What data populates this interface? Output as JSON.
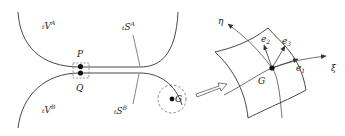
{
  "diagram": {
    "type": "contact-mechanics-schematic",
    "left_panel": {
      "bodies": [
        {
          "id": "body-A",
          "label_prefix": "t",
          "label": "V",
          "superscript": "A"
        },
        {
          "id": "body-B",
          "label_prefix": "t",
          "label": "V",
          "superscript": "B"
        }
      ],
      "surfaces": [
        {
          "id": "surface-A",
          "label_prefix": "t",
          "label": "S",
          "superscript": "A"
        },
        {
          "id": "surface-B",
          "label_prefix": "t",
          "label": "S",
          "superscript": "B"
        }
      ],
      "points": [
        {
          "id": "P",
          "label": "P"
        },
        {
          "id": "Q",
          "label": "Q"
        },
        {
          "id": "G",
          "label": "G"
        }
      ]
    },
    "arrow": {
      "meaning": "magnify",
      "from": "G",
      "to": "surface-patch"
    },
    "right_panel": {
      "point": {
        "label": "G"
      },
      "curvilinear_axes": [
        {
          "id": "xi",
          "label": "ξ"
        },
        {
          "id": "eta",
          "label": "η"
        }
      ],
      "base_vectors": [
        {
          "id": "e1",
          "label": "e",
          "subscript": "1"
        },
        {
          "id": "e2",
          "label": "e",
          "subscript": "2"
        },
        {
          "id": "e3",
          "label": "e",
          "subscript": "3"
        }
      ]
    },
    "colors": {
      "stroke": "#333333",
      "fill_point": "#111111",
      "background": "#ffffff"
    }
  }
}
